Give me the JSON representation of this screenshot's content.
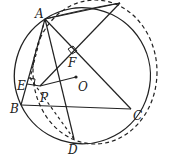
{
  "figure": {
    "type": "geometry",
    "stroke_color": "#222222",
    "points": {
      "A": {
        "label": "A",
        "x": 45,
        "y": 19
      },
      "T": {
        "label": "",
        "x": 120,
        "y": 3
      },
      "B": {
        "label": "B",
        "x": 21,
        "y": 105
      },
      "C": {
        "label": "C",
        "x": 131,
        "y": 109
      },
      "D": {
        "label": "D",
        "x": 74,
        "y": 139
      },
      "E": {
        "label": "E",
        "x": 27,
        "y": 84
      },
      "F": {
        "label": "F",
        "x": 73,
        "y": 54
      },
      "O": {
        "label": "O",
        "x": 76,
        "y": 77
      },
      "P": {
        "label": "P",
        "x": 40,
        "y": 86
      }
    },
    "labels": [
      "A",
      "B",
      "C",
      "D",
      "E",
      "F",
      "O",
      "P"
    ],
    "solid_circle": {
      "cx": 76,
      "cy": 77,
      "r": 71
    },
    "dashed_circle": {
      "description": "circumcircle through A, T, D, E"
    }
  }
}
